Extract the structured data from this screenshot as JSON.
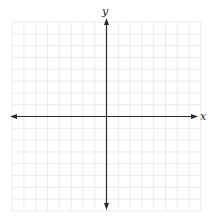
{
  "diagram": {
    "type": "cartesian-coordinate-grid",
    "axes": {
      "x_label": "x",
      "y_label": "y",
      "arrows": "both-ends"
    },
    "grid": {
      "cells_per_side": 8,
      "total_columns": 16,
      "total_rows": 16,
      "tick_labels": "none"
    },
    "colors": {
      "grid": "#e6e6e6",
      "axis": "#2a2a2a",
      "background": "#ffffff"
    }
  }
}
